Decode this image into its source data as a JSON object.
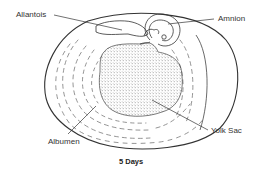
{
  "figure": {
    "caption": "5 Days",
    "labels": {
      "allantois": "Allantois",
      "amnion": "Amnion",
      "albumen": "Albumen",
      "yolk_sac": "Yolk Sac"
    }
  },
  "colors": {
    "line": "#333333",
    "stipple": "#8a8a8a",
    "background": "#ffffff"
  }
}
